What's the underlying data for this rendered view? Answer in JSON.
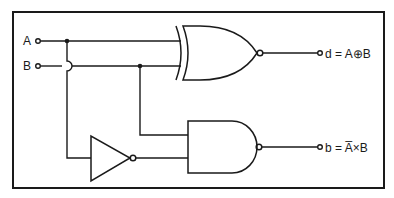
{
  "diagram": {
    "type": "logic-circuit",
    "inputs": [
      {
        "id": "A",
        "label": "A"
      },
      {
        "id": "B",
        "label": "B"
      }
    ],
    "gates": [
      {
        "id": "xnor",
        "type": "XNOR",
        "inputs": [
          "A",
          "B"
        ],
        "output": "d"
      },
      {
        "id": "not",
        "type": "NOT",
        "inputs": [
          "A"
        ]
      },
      {
        "id": "nand",
        "type": "NAND",
        "inputs": [
          "not",
          "B"
        ],
        "output": "b"
      }
    ],
    "outputs": [
      {
        "id": "d",
        "label": "d = A⊕B"
      },
      {
        "id": "b",
        "label": "b = A̅×B"
      }
    ]
  },
  "colors": {
    "line": "#1a1a1a",
    "background": "#ffffff"
  }
}
